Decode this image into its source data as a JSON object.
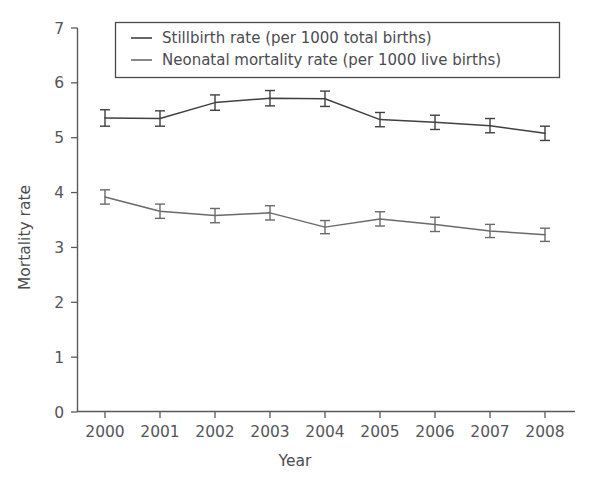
{
  "chart_data": {
    "type": "line",
    "title": "",
    "xlabel": "Year",
    "ylabel": "Mortality rate",
    "categories": [
      2000,
      2001,
      2002,
      2003,
      2004,
      2005,
      2006,
      2007,
      2008
    ],
    "x_tick_labels": [
      "2000",
      "2001",
      "2002",
      "2003",
      "2004",
      "2005",
      "2006",
      "2007",
      "2008"
    ],
    "y_tick_labels": [
      "0",
      "1",
      "2",
      "3",
      "4",
      "5",
      "6",
      "7"
    ],
    "y_ticks": [
      0,
      1,
      2,
      3,
      4,
      5,
      6,
      7
    ],
    "ylim": [
      0,
      7
    ],
    "xlim": [
      2000,
      2008
    ],
    "grid": false,
    "legend_position": "top",
    "error_bars": "95% confidence interval",
    "series": [
      {
        "name": "Stillbirth rate (per 1000 total births)",
        "color": "#404040",
        "values": [
          5.36,
          5.35,
          5.64,
          5.72,
          5.71,
          5.33,
          5.28,
          5.22,
          5.08
        ],
        "err_low": [
          5.21,
          5.21,
          5.5,
          5.58,
          5.57,
          5.2,
          5.15,
          5.09,
          4.95
        ],
        "err_high": [
          5.51,
          5.49,
          5.78,
          5.86,
          5.85,
          5.46,
          5.41,
          5.35,
          5.21
        ]
      },
      {
        "name": "Neonatal mortality rate (per 1000 live births)",
        "color": "#6a6a6a",
        "values": [
          3.92,
          3.66,
          3.58,
          3.63,
          3.37,
          3.52,
          3.42,
          3.3,
          3.23
        ],
        "err_low": [
          3.79,
          3.53,
          3.45,
          3.5,
          3.25,
          3.39,
          3.29,
          3.18,
          3.11
        ],
        "err_high": [
          4.05,
          3.79,
          3.71,
          3.76,
          3.49,
          3.65,
          3.55,
          3.42,
          3.35
        ]
      }
    ]
  },
  "legend": {
    "items": [
      {
        "label": "Stillbirth rate (per 1000 total births)"
      },
      {
        "label": "Neonatal mortality rate (per 1000 live births)"
      }
    ]
  },
  "axes": {
    "y_title": "Mortality rate",
    "x_title": "Year"
  }
}
